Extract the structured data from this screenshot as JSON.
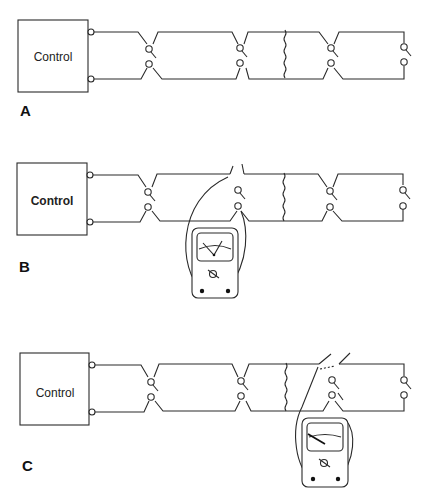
{
  "diagram": {
    "type": "wiring-continuity-test",
    "panels": [
      {
        "id": "A",
        "label": "A",
        "control_label": "Control",
        "description": "Control box feeding a two-wire circuit with three pairs of switch contacts and a break (wavy line) in the wiring; end contacts open.",
        "meter_present": false
      },
      {
        "id": "B",
        "label": "B",
        "control_label": "Control",
        "description": "Meter leads connected across the first disconnected contact pair; meter needle deflected.",
        "meter_present": true,
        "meter_reading": "deflected"
      },
      {
        "id": "C",
        "label": "C",
        "control_label": "Control",
        "description": "Meter leads connected across the contact pair past the break; meter needle at rest.",
        "meter_present": true,
        "meter_reading": "no-deflection"
      }
    ]
  }
}
